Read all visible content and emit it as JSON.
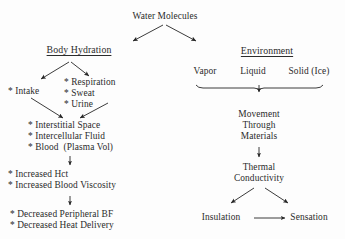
{
  "diagram": {
    "title": "Water Molecules",
    "colors": {
      "text": "#2b2b2b",
      "line": "#262626",
      "background": "#fdfdfd"
    },
    "branches": {
      "left": {
        "heading": "Body Hydration",
        "intake": "* Intake",
        "losses": "* Respiration\n* Sweat\n* Urine",
        "compartments": "* Interstitial Space\n* Intercellular Fluid\n* Blood  (Plasma Vol)",
        "blood_changes": "* Increased Hct\n* Increased Blood Viscosity",
        "outcomes": "* Decreased Peripheral BF\n* Decreased Heat Delivery"
      },
      "right": {
        "heading": "Environment",
        "phases": [
          "Vapor",
          "Liquid",
          "Solid (Ice)"
        ],
        "movement": "Movement\nThrough\nMaterials",
        "thermal": "Thermal\nConductivity",
        "insulation": "Insulation",
        "sensation": "Sensation"
      }
    }
  }
}
